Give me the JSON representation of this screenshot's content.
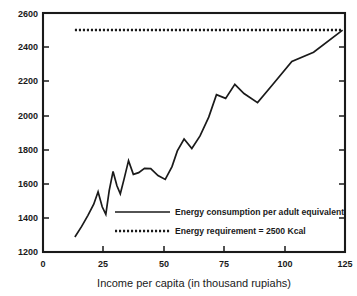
{
  "chart_data": {
    "type": "line",
    "title": "",
    "xlabel": "Income per capita (in thousand rupiahs)",
    "ylabel": "",
    "xlim": [
      0,
      125
    ],
    "ylim": [
      1200,
      2600
    ],
    "xticks": [
      0,
      25,
      50,
      75,
      100,
      125
    ],
    "yticks": [
      1200,
      1400,
      1600,
      1800,
      2000,
      2200,
      2400,
      2600
    ],
    "grid": false,
    "legend_position": "center-right-inside",
    "series": [
      {
        "name": "Energy consumption per adult equivalent",
        "style": "solid",
        "color": "#1a1a1a",
        "x": [
          13.2,
          16.0,
          18.6,
          21.0,
          22.8,
          24.5,
          26.0,
          27.4,
          29.0,
          30.6,
          32.0,
          33.6,
          35.4,
          37.4,
          39.6,
          42.0,
          44.6,
          47.6,
          50.6,
          53.4,
          55.6,
          58.4,
          61.6,
          65.0,
          68.6,
          71.8,
          75.6,
          79.4,
          83.2,
          88.8,
          95.0,
          103.0,
          112.0,
          124.0
        ],
        "y": [
          1288,
          1350,
          1415,
          1480,
          1553,
          1465,
          1421,
          1560,
          1672,
          1588,
          1541,
          1630,
          1735,
          1655,
          1665,
          1690,
          1688,
          1648,
          1625,
          1700,
          1792,
          1862,
          1806,
          1880,
          1990,
          2122,
          2100,
          2182,
          2128,
          2075,
          2180,
          2316,
          2370,
          2500
        ]
      },
      {
        "name": "Energy requirement = 2500 Kcal",
        "style": "dotted",
        "color": "#1a1a1a",
        "constant_value": 2500,
        "x": [
          13.2,
          124.0
        ],
        "y": [
          2500,
          2500
        ]
      }
    ]
  },
  "legend": {
    "items": [
      {
        "label": "Energy consumption per adult equivalent",
        "style": "solid"
      },
      {
        "label": "Energy requirement = 2500 Kcal",
        "style": "dotted"
      }
    ]
  },
  "axis": {
    "x_title": "Income per capita (in thousand rupiahs)",
    "x_tick_labels": [
      "0",
      "25",
      "50",
      "75",
      "100",
      "125"
    ],
    "y_tick_labels": [
      "1200",
      "1400",
      "1600",
      "1800",
      "2000",
      "2200",
      "2400",
      "2600"
    ]
  }
}
